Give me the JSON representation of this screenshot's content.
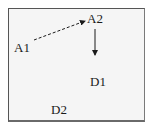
{
  "diagram": {
    "nodes": [
      {
        "id": "A1",
        "label": "A1"
      },
      {
        "id": "A2",
        "label": "A2"
      },
      {
        "id": "D1",
        "label": "D1"
      },
      {
        "id": "D2",
        "label": "D2"
      }
    ],
    "edges": [
      {
        "from": "A1",
        "to": "A2",
        "style": "dashed"
      },
      {
        "from": "A2",
        "to": "D1",
        "style": "solid"
      }
    ]
  }
}
